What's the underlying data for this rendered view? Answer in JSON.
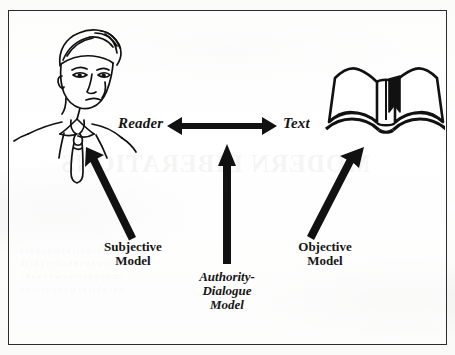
{
  "figure": {
    "kind": "diagram",
    "border_color": "#2b2b2b",
    "ink_color": "#111111",
    "background_color": "#fdfdfc"
  },
  "nodes": [
    {
      "id": "reader",
      "label": "Reader",
      "icon": "man-portrait-illustration",
      "style": "bold-italic-serif"
    },
    {
      "id": "text",
      "label": "Text",
      "icon": "open-book-illustration",
      "style": "bold-italic-serif"
    }
  ],
  "connectors": [
    {
      "id": "reader-text-link",
      "type": "double-headed-arrow",
      "orientation": "horizontal",
      "from": "reader",
      "to": "text"
    },
    {
      "id": "subjective-arrow",
      "type": "single-headed-arrow",
      "orientation": "diagonal-up-left",
      "points_to": "reader"
    },
    {
      "id": "authority-dialogue-arrow",
      "type": "single-headed-arrow",
      "orientation": "vertical-up",
      "points_to": "reader-text-link"
    },
    {
      "id": "objective-arrow",
      "type": "single-headed-arrow",
      "orientation": "diagonal-up-right",
      "points_to": "text"
    }
  ],
  "model_labels": [
    {
      "id": "subjective-model",
      "lines": [
        "Subjective",
        "Model"
      ],
      "style": "bold-roman-serif"
    },
    {
      "id": "authority-dialogue-model",
      "lines": [
        "Authority-",
        "Dialogue",
        "Model"
      ],
      "style": "bold-italic-serif"
    },
    {
      "id": "objective-model",
      "lines": [
        "Objective",
        "Model"
      ],
      "style": "bold-roman-serif"
    }
  ],
  "scan_artifacts": {
    "bleed_heading": "MODERN LIBERATIONS",
    "bleed_body_lines": [
      "a b c d e f g h i j k l m n o p q r s",
      "t u v w x y z a b c d e f g h i j k",
      "l m n o p q r s t u v w x y z a b c",
      "d e f g h i j k l m n o p q r s t u v"
    ]
  }
}
